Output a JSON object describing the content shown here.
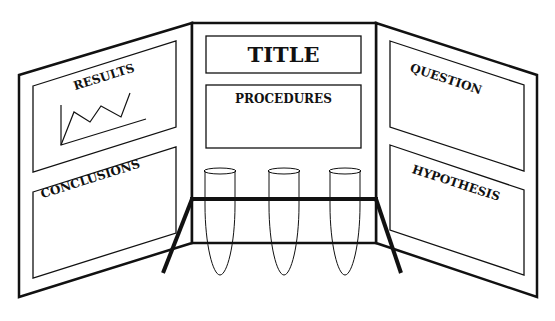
{
  "diagram": {
    "colors": {
      "stroke": "#111111",
      "background": "#ffffff"
    },
    "left_panel": {
      "sections": [
        {
          "label": "RESULTS",
          "has_graph_icon": true
        },
        {
          "label": "CONCLUSIONS"
        }
      ]
    },
    "center_panel": {
      "title": "TITLE",
      "sections": [
        {
          "label": "PROCEDURES"
        }
      ],
      "test_tubes": 3
    },
    "right_panel": {
      "sections": [
        {
          "label": "QUESTION"
        },
        {
          "label": "HYPOTHESIS"
        }
      ]
    }
  }
}
